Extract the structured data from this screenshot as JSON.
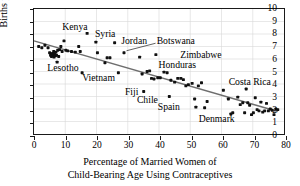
{
  "chart_data": {
    "type": "scatter",
    "title": "",
    "xlabel": "Percentage of Married Women of Child-Bearing Age Using Contraceptives",
    "xlabel_lines": [
      "Percentage of Married Women of",
      "Child-Bearing Age Using Contraceptives"
    ],
    "ylabel": "Births per Woman",
    "xlim": [
      0,
      80
    ],
    "ylim": [
      0,
      10
    ],
    "xticks": [
      0,
      10,
      20,
      30,
      40,
      50,
      60,
      70,
      80
    ],
    "yticks": [
      0,
      1,
      2,
      3,
      4,
      5,
      6,
      7,
      8,
      9,
      10
    ],
    "grid": true,
    "legend": "none",
    "marker_color": "#101010",
    "fitline_color": "#6e6e6e",
    "fit_line": {
      "label": "least-squares fit",
      "x": [
        0,
        78
      ],
      "y": [
        7.45,
        1.8
      ]
    },
    "points": [
      {
        "x": 1.5,
        "y": 7.0
      },
      {
        "x": 2.5,
        "y": 6.9
      },
      {
        "x": 3.5,
        "y": 7.1
      },
      {
        "x": 4.5,
        "y": 6.9
      },
      {
        "x": 5.0,
        "y": 6.5
      },
      {
        "x": 5.3,
        "y": 6.3
      },
      {
        "x": 5.6,
        "y": 6.2
      },
      {
        "x": 5.9,
        "y": 6.45
      },
      {
        "x": 6.1,
        "y": 6.35
      },
      {
        "x": 6.3,
        "y": 6.6
      },
      {
        "x": 6.4,
        "y": 6.15
      },
      {
        "x": 6.6,
        "y": 6.4
      },
      {
        "x": 6.8,
        "y": 6.25
      },
      {
        "x": 7.0,
        "y": 6.55
      },
      {
        "x": 7.2,
        "y": 6.3
      },
      {
        "x": 7.4,
        "y": 5.75
      },
      {
        "x": 7.6,
        "y": 6.7
      },
      {
        "x": 7.9,
        "y": 6.2
      },
      {
        "x": 8.2,
        "y": 6.75
      },
      {
        "x": 8.6,
        "y": 7.0
      },
      {
        "x": 9.0,
        "y": 6.6
      },
      {
        "x": 9.6,
        "y": 7.45
      },
      {
        "x": 10.2,
        "y": 6.7
      },
      {
        "x": 10.8,
        "y": 6.65
      },
      {
        "x": 12.0,
        "y": 6.6
      },
      {
        "x": 13.2,
        "y": 6.55
      },
      {
        "x": 14.3,
        "y": 7.0
      },
      {
        "x": 14.8,
        "y": 6.6
      },
      {
        "x": 15.4,
        "y": 4.9
      },
      {
        "x": 17.0,
        "y": 8.05
      },
      {
        "x": 19.8,
        "y": 7.35
      },
      {
        "x": 20.3,
        "y": 6.5
      },
      {
        "x": 22.7,
        "y": 5.7
      },
      {
        "x": 23.4,
        "y": 6.1
      },
      {
        "x": 24.3,
        "y": 6.1
      },
      {
        "x": 25.8,
        "y": 7.3
      },
      {
        "x": 27.0,
        "y": 4.9
      },
      {
        "x": 28.8,
        "y": 6.5
      },
      {
        "x": 33.8,
        "y": 6.15
      },
      {
        "x": 34.6,
        "y": 4.8
      },
      {
        "x": 35.1,
        "y": 3.4
      },
      {
        "x": 36.2,
        "y": 5.0
      },
      {
        "x": 37.0,
        "y": 5.05
      },
      {
        "x": 37.6,
        "y": 4.45
      },
      {
        "x": 38.4,
        "y": 4.4
      },
      {
        "x": 39.0,
        "y": 6.35
      },
      {
        "x": 39.6,
        "y": 4.5
      },
      {
        "x": 40.4,
        "y": 4.5
      },
      {
        "x": 41.6,
        "y": 4.95
      },
      {
        "x": 42.6,
        "y": 4.9
      },
      {
        "x": 43.3,
        "y": 3.0
      },
      {
        "x": 43.8,
        "y": 4.3
      },
      {
        "x": 45.0,
        "y": 4.15
      },
      {
        "x": 46.0,
        "y": 4.45
      },
      {
        "x": 47.0,
        "y": 4.45
      },
      {
        "x": 47.8,
        "y": 4.35
      },
      {
        "x": 48.6,
        "y": 3.85
      },
      {
        "x": 49.4,
        "y": 3.95
      },
      {
        "x": 50.6,
        "y": 4.05
      },
      {
        "x": 51.4,
        "y": 2.8
      },
      {
        "x": 51.8,
        "y": 2.15
      },
      {
        "x": 52.6,
        "y": 3.85
      },
      {
        "x": 53.6,
        "y": 4.1
      },
      {
        "x": 54.6,
        "y": 2.1
      },
      {
        "x": 55.4,
        "y": 2.6
      },
      {
        "x": 60.6,
        "y": 3.5
      },
      {
        "x": 62.2,
        "y": 2.8
      },
      {
        "x": 63.0,
        "y": 1.6
      },
      {
        "x": 63.6,
        "y": 1.7
      },
      {
        "x": 65.2,
        "y": 2.95
      },
      {
        "x": 66.0,
        "y": 2.35
      },
      {
        "x": 66.8,
        "y": 2.5
      },
      {
        "x": 67.4,
        "y": 1.7
      },
      {
        "x": 67.9,
        "y": 3.6
      },
      {
        "x": 68.4,
        "y": 2.5
      },
      {
        "x": 69.0,
        "y": 2.3
      },
      {
        "x": 69.6,
        "y": 1.55
      },
      {
        "x": 70.2,
        "y": 1.7
      },
      {
        "x": 70.8,
        "y": 2.9
      },
      {
        "x": 71.4,
        "y": 1.95
      },
      {
        "x": 72.0,
        "y": 1.85
      },
      {
        "x": 72.6,
        "y": 2.55
      },
      {
        "x": 73.2,
        "y": 1.75
      },
      {
        "x": 73.8,
        "y": 1.85
      },
      {
        "x": 74.4,
        "y": 2.45
      },
      {
        "x": 75.0,
        "y": 1.85
      },
      {
        "x": 75.6,
        "y": 2.0
      },
      {
        "x": 76.2,
        "y": 1.9
      },
      {
        "x": 76.8,
        "y": 1.55
      },
      {
        "x": 77.4,
        "y": 2.0
      },
      {
        "x": 78.0,
        "y": 1.95
      }
    ],
    "annotations": [
      {
        "name": "Kenya",
        "text": "Kenya",
        "x": 13.0,
        "y": 8.55,
        "anchor": "middle",
        "leader": false
      },
      {
        "name": "Syria",
        "text": "Syria",
        "x": 22.6,
        "y": 8.05,
        "anchor": "middle",
        "leader": false
      },
      {
        "name": "Jordan",
        "text": "Jordan",
        "x": 31.8,
        "y": 7.45,
        "anchor": "middle",
        "leader": false
      },
      {
        "name": "Botswana",
        "text": "Botswana",
        "x": 45.0,
        "y": 7.45,
        "anchor": "middle",
        "leader": true,
        "leader_from": {
          "x": 38.9,
          "y": 7.26
        },
        "leader_to": {
          "x": 29.6,
          "y": 6.66
        }
      },
      {
        "name": "Zimbabwe",
        "text": "Zimbabwe",
        "x": 53.0,
        "y": 6.4,
        "anchor": "middle",
        "leader": false
      },
      {
        "name": "Honduras",
        "text": "Honduras",
        "x": 45.5,
        "y": 5.6,
        "anchor": "middle",
        "leader": false
      },
      {
        "name": "Lesotho",
        "text": "Lesotho",
        "x": 9.2,
        "y": 5.35,
        "anchor": "middle",
        "leader": false
      },
      {
        "name": "Vietnam",
        "text": "Vietnam",
        "x": 20.5,
        "y": 4.55,
        "anchor": "middle",
        "leader": false
      },
      {
        "name": "Costa Rica",
        "text": "Costa Rica",
        "x": 68.5,
        "y": 4.25,
        "anchor": "middle",
        "leader": false
      },
      {
        "name": "Fiji",
        "text": "Fiji",
        "x": 31.0,
        "y": 3.45,
        "anchor": "middle",
        "leader": false
      },
      {
        "name": "Chile",
        "text": "Chile",
        "x": 36.0,
        "y": 2.85,
        "anchor": "middle",
        "leader": false
      },
      {
        "name": "Spain",
        "text": "Spain",
        "x": 42.8,
        "y": 2.3,
        "anchor": "middle",
        "leader": false
      },
      {
        "name": "Denmark",
        "text": "Denmark",
        "x": 58.0,
        "y": 1.35,
        "anchor": "middle",
        "leader": false
      }
    ]
  }
}
